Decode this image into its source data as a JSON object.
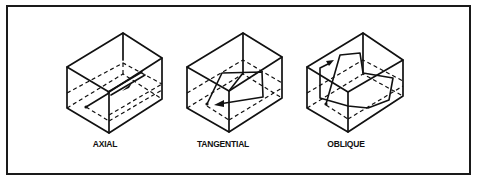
{
  "figure": {
    "frame": {
      "x": 7,
      "y": 6,
      "w": 463,
      "h": 168,
      "color": "#1a1a1a"
    },
    "modes": [
      {
        "id": "axial",
        "label": "AXIAL",
        "label_pos": {
          "x": 105,
          "y": 147
        },
        "box": {
          "top": [
            123,
            33
          ],
          "left_top": [
            67,
            67
          ],
          "front_top": [
            109,
            92
          ],
          "right_top": [
            162,
            58
          ],
          "left_bottom": [
            67,
            108
          ],
          "front_bottom": [
            109,
            133
          ],
          "right_bottom": [
            162,
            99
          ],
          "back_bottom": [
            123,
            74
          ]
        }
      },
      {
        "id": "tangential",
        "label": "TANGENTIAL",
        "label_pos": {
          "x": 223,
          "y": 147
        },
        "box": {
          "top": [
            243,
            33
          ],
          "left_top": [
            187,
            67
          ],
          "front_top": [
            229,
            91
          ],
          "right_top": [
            282,
            57
          ],
          "left_bottom": [
            187,
            108
          ],
          "front_bottom": [
            229,
            132
          ],
          "right_bottom": [
            282,
            98
          ],
          "back_bottom": [
            243,
            74
          ]
        }
      },
      {
        "id": "oblique",
        "label": "OBLIQUE",
        "label_pos": {
          "x": 346,
          "y": 147
        },
        "box": {
          "top": [
            363,
            33
          ],
          "left_top": [
            307,
            67
          ],
          "front_top": [
            348,
            92
          ],
          "right_top": [
            403,
            60
          ],
          "left_bottom": [
            307,
            108
          ],
          "front_bottom": [
            348,
            132
          ],
          "right_bottom": [
            403,
            96
          ],
          "back_bottom": [
            363,
            74
          ]
        }
      }
    ]
  }
}
